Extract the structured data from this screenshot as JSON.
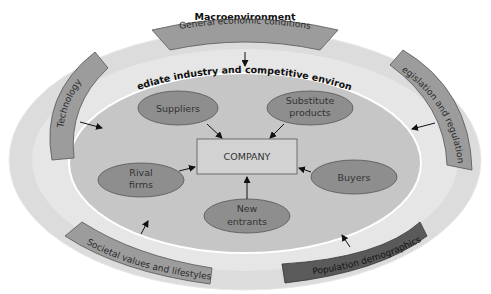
{
  "diagram": {
    "title": "Macroenvironment",
    "inner_title": "Immediate industry and competitive environment",
    "center": "COMPANY",
    "forces": [
      {
        "id": "suppliers",
        "lines": [
          "Suppliers"
        ]
      },
      {
        "id": "substitutes",
        "lines": [
          "Substitute",
          "products"
        ]
      },
      {
        "id": "rivals",
        "lines": [
          "Rival",
          "firms"
        ]
      },
      {
        "id": "buyers",
        "lines": [
          "Buyers"
        ]
      },
      {
        "id": "new_entrants",
        "lines": [
          "New",
          "entrants"
        ]
      }
    ],
    "macro_factors": [
      {
        "id": "economic",
        "label": "General economic conditions"
      },
      {
        "id": "technology",
        "label": "Technology"
      },
      {
        "id": "legislation",
        "label": "Legislation and regulations"
      },
      {
        "id": "societal",
        "label": "Societal values and lifestyles"
      },
      {
        "id": "demographics",
        "label": "Population demographics"
      }
    ],
    "colors": {
      "outer_ring": "#dedede",
      "middle_ring": "#e9e9e9",
      "inner_ellipse": "#c4c4c4",
      "force_ellipse": "#8e8e8e",
      "company_box": "#d2d2d2",
      "macro_band": "#9c9c9c",
      "demographics_band": "#5a5a5a"
    }
  }
}
